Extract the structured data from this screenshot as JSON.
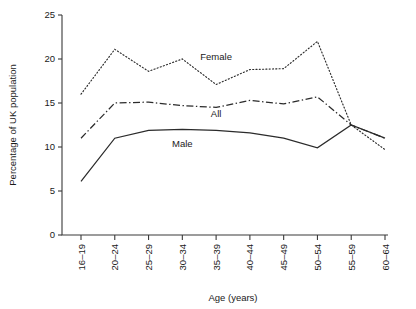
{
  "chart_data": {
    "type": "line",
    "title": "",
    "xlabel": "Age (years)",
    "ylabel": "Percentage of UK population",
    "categories": [
      "16–19",
      "20–24",
      "25–29",
      "30–34",
      "35–39",
      "40–44",
      "45–49",
      "50–54",
      "55–59",
      "60–64"
    ],
    "ylim": [
      0,
      25
    ],
    "yticks": [
      0,
      5,
      10,
      15,
      20,
      25
    ],
    "ytick_labels": [
      "0",
      "5",
      "10",
      "15",
      "20",
      "25"
    ],
    "grid": false,
    "legend_position": "inline-annotations",
    "series": [
      {
        "name": "Female",
        "style": "dotted",
        "values": [
          16.0,
          21.1,
          18.6,
          20.0,
          17.1,
          18.8,
          18.9,
          22.0,
          12.5,
          9.7
        ]
      },
      {
        "name": "All",
        "style": "dash-dot",
        "values": [
          11.0,
          15.0,
          15.1,
          14.7,
          14.5,
          15.3,
          14.9,
          15.7,
          12.5,
          11.0
        ]
      },
      {
        "name": "Male",
        "style": "solid",
        "values": [
          6.1,
          11.0,
          11.9,
          12.0,
          11.9,
          11.6,
          11.0,
          9.9,
          12.5,
          11.0
        ]
      }
    ],
    "annotations": [
      {
        "text": "Female",
        "x_category": "35–39",
        "y": 19.9
      },
      {
        "text": "All",
        "x_category": "35–39",
        "y": 13.4
      },
      {
        "text": "Male",
        "x_category": "30–34",
        "y": 10.0
      }
    ]
  }
}
